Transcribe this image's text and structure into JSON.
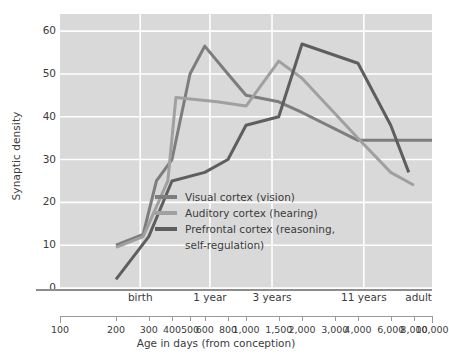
{
  "chart_data": {
    "type": "line",
    "title": "",
    "xlabel": "Age in days (from conception)",
    "ylabel": "Synaptic density",
    "xscale": "log",
    "xlim": [
      100,
      10000
    ],
    "ylim": [
      0,
      64
    ],
    "yticks": [
      0,
      10,
      20,
      30,
      40,
      50,
      60
    ],
    "xticks": [
      100,
      200,
      300,
      400,
      500,
      600,
      800,
      1000,
      1500,
      2000,
      3000,
      4000,
      6000,
      8000,
      10000
    ],
    "xtick_labels": [
      "100",
      "200",
      "300",
      "400",
      "500",
      "600",
      "800",
      "1,000",
      "1,500",
      "2,000",
      "3,000",
      "4,000",
      "6,000",
      "8,000",
      "10,000"
    ],
    "milestones": [
      {
        "label": "birth",
        "x": 270
      },
      {
        "label": "1 year",
        "x": 640
      },
      {
        "label": "3 years",
        "x": 1380
      },
      {
        "label": "11 years",
        "x": 4300
      },
      {
        "label": "adult",
        "x": 10000
      }
    ],
    "gridlines_vertical": [
      270,
      640,
      1380,
      4300
    ],
    "grid": true,
    "legend_position": "center-left-inside",
    "series": [
      {
        "name": "Visual cortex (vision)",
        "color": "#7d7d7d",
        "x": [
          200,
          280,
          330,
          400,
          500,
          600,
          800,
          1000,
          1500,
          2000,
          4000,
          6000,
          10000
        ],
        "y": [
          10,
          12.5,
          25,
          30,
          50,
          56.5,
          50,
          45,
          43.5,
          41,
          34.5,
          34.5,
          34.5
        ]
      },
      {
        "name": "Auditory cortex (hearing)",
        "color": "#a0a0a0",
        "x": [
          200,
          280,
          380,
          420,
          700,
          1000,
          1500,
          2000,
          4000,
          6000,
          8000
        ],
        "y": [
          9.5,
          12,
          25,
          44.5,
          43.5,
          42.5,
          53,
          49,
          35,
          27,
          24
        ]
      },
      {
        "name": "Prefrontal cortex (reasoning, self-regulation)",
        "color": "#5e5e5e",
        "x": [
          200,
          300,
          400,
          600,
          800,
          1000,
          1500,
          2000,
          4000,
          6000,
          7500
        ],
        "y": [
          2,
          12,
          25,
          27,
          30,
          38,
          40,
          57,
          52.5,
          38,
          27
        ]
      }
    ],
    "legend": [
      {
        "label": "Visual cortex (vision)",
        "color": "#7d7d7d",
        "continuation": ""
      },
      {
        "label": "Auditory cortex (hearing)",
        "color": "#a0a0a0",
        "continuation": ""
      },
      {
        "label": "Prefrontal cortex (reasoning,",
        "color": "#5e5e5e",
        "continuation": "self-regulation)"
      }
    ]
  },
  "style": {
    "plot_background": "#d9d9d9",
    "gridline_color": "#ffffff",
    "axis_color": "#8d8d8d",
    "text_color": "#3b3b3b"
  }
}
